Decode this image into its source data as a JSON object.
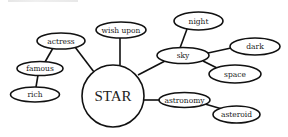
{
  "diagram": {
    "type": "word-web",
    "center": {
      "id": "star",
      "label": "STAR"
    },
    "nodes": [
      {
        "id": "actress",
        "label": "actress"
      },
      {
        "id": "famous",
        "label": "famous"
      },
      {
        "id": "rich",
        "label": "rich"
      },
      {
        "id": "wish_upon",
        "label": "wish upon"
      },
      {
        "id": "sky",
        "label": "sky"
      },
      {
        "id": "night",
        "label": "night"
      },
      {
        "id": "dark",
        "label": "dark"
      },
      {
        "id": "space",
        "label": "space"
      },
      {
        "id": "astronomy",
        "label": "astronomy"
      },
      {
        "id": "asteroid",
        "label": "asteroid"
      }
    ],
    "edges": [
      [
        "star",
        "actress"
      ],
      [
        "actress",
        "famous"
      ],
      [
        "famous",
        "rich"
      ],
      [
        "star",
        "wish_upon"
      ],
      [
        "star",
        "sky"
      ],
      [
        "sky",
        "night"
      ],
      [
        "sky",
        "dark"
      ],
      [
        "sky",
        "space"
      ],
      [
        "star",
        "astronomy"
      ],
      [
        "astronomy",
        "asteroid"
      ]
    ]
  }
}
